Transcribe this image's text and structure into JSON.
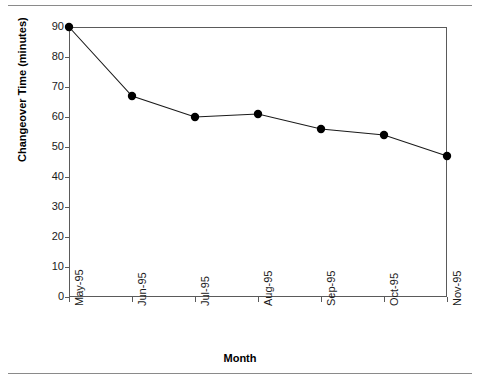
{
  "chart_data": {
    "type": "line",
    "title": "",
    "xlabel": "Month",
    "ylabel": "Changeover Time (minutes)",
    "categories": [
      "May-95",
      "Jun-95",
      "Jul-95",
      "Aug-95",
      "Sep-95",
      "Oct-95",
      "Nov-95"
    ],
    "values": [
      90,
      67,
      60,
      61,
      56,
      54,
      47
    ],
    "series": [
      {
        "name": "Changeover Time",
        "values": [
          90,
          67,
          60,
          61,
          56,
          54,
          47
        ]
      }
    ],
    "ylim": [
      0,
      90
    ],
    "ytick_labels": [
      "0",
      "10",
      "20",
      "30",
      "40",
      "50",
      "60",
      "70",
      "80",
      "90"
    ],
    "ytick_values": [
      0,
      10,
      20,
      30,
      40,
      50,
      60,
      70,
      80,
      90
    ],
    "grid": false,
    "legend": false,
    "legend_position": "none",
    "marker": "filled-circle",
    "line_color": "#1a1a1a",
    "marker_color": "#000000",
    "frame_color": "#5a5a5a",
    "background": "#ffffff"
  },
  "figure": {
    "top_rule_color": "#8a8a8a",
    "bottom_rule_color": "#8a8a8a"
  }
}
